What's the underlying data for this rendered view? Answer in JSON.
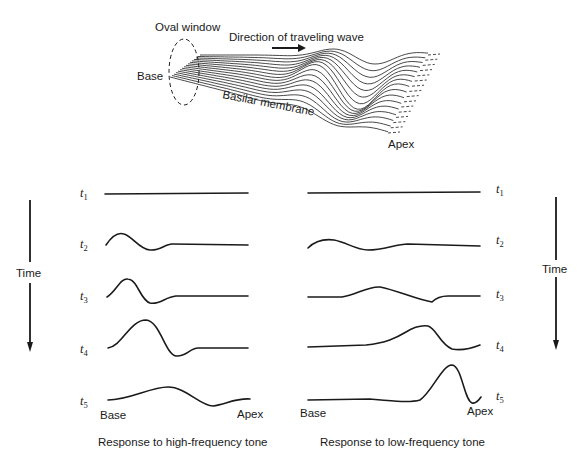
{
  "illustration": {
    "oval_window_label": "Oval window",
    "direction_label": "Direction of traveling wave",
    "base_label": "Base",
    "membrane_label": "Basilar membrane",
    "apex_label": "Apex"
  },
  "time_label": "Time",
  "panels": [
    {
      "id": "high",
      "caption": "Response to high-frequency tone",
      "base_label": "Base",
      "apex_label": "Apex",
      "rows": [
        {
          "t": "t",
          "sub": "1",
          "path": "M105,194 L248,193"
        },
        {
          "t": "t",
          "sub": "2",
          "path": "M106,245 C112,236 118,232 124,234 C132,236 140,250 150,250 C160,251 165,244 172,244 L248,245"
        },
        {
          "t": "t",
          "sub": "3",
          "path": "M107,297 C116,292 120,278 128,279 C138,280 140,300 150,303 C160,305 165,297 176,296 L248,296"
        },
        {
          "t": "t",
          "sub": "4",
          "path": "M108,348 C122,346 130,320 146,320 C160,321 165,354 176,356 C186,357 190,348 198,348 L248,348"
        },
        {
          "t": "t",
          "sub": "5",
          "path": "M108,400 C130,400 150,387 168,387 C186,387 200,406 213,406 C226,404 236,398 250,399"
        }
      ]
    },
    {
      "id": "low",
      "caption": "Response to low-frequency tone",
      "base_label": "Base",
      "apex_label": "Apex",
      "rows": [
        {
          "t": "t",
          "sub": "1",
          "path": "M308,193 L480,192"
        },
        {
          "t": "t",
          "sub": "2",
          "path": "M308,248 C316,240 326,239 334,240 C346,242 356,250 368,250 C384,250 396,244 408,244 L480,246"
        },
        {
          "t": "t",
          "sub": "3",
          "path": "M308,297 L342,297 C356,295 368,286 380,287 C396,290 418,300 432,302 C436,298 442,296 448,296 L480,296"
        },
        {
          "t": "t",
          "sub": "4",
          "path": "M308,347 L366,345 C386,343 396,338 406,332 C414,327 420,325 428,326 C436,328 440,344 452,349 C462,351 470,349 480,345"
        },
        {
          "t": "t",
          "sub": "5",
          "path": "M308,400 L370,399 C392,401 410,403 420,400 C432,392 442,365 452,365 C462,366 464,400 472,403 C476,404 479,400 481,397"
        }
      ]
    }
  ]
}
